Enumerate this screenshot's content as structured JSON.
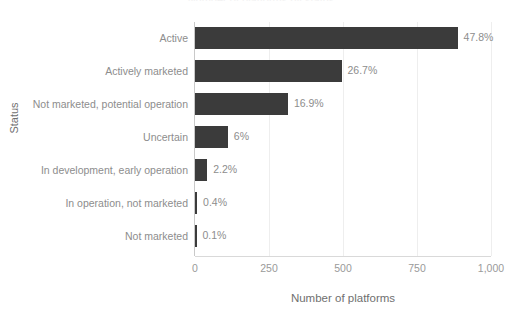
{
  "chart_data": {
    "type": "bar",
    "orientation": "horizontal",
    "title": "Number of platforms by status",
    "xlabel": "Number of platforms",
    "ylabel": "Status",
    "categories": [
      "Active",
      "Actively marketed",
      "Not marketed, potential operation",
      "Uncertain",
      "In development, early operation",
      "In operation, not marketed",
      "Not marketed"
    ],
    "values": [
      887,
      495,
      314,
      111,
      41,
      7,
      2
    ],
    "data_labels": [
      "47.8%",
      "26.7%",
      "16.9%",
      "6%",
      "2.2%",
      "0.4%",
      "0.1%"
    ],
    "percentages": [
      47.8,
      26.7,
      16.9,
      6.0,
      2.2,
      0.4,
      0.1
    ],
    "xlim": [
      0,
      1000
    ],
    "xticks": [
      0,
      250,
      500,
      750,
      1000
    ],
    "xtick_labels": [
      "0",
      "250",
      "500",
      "750",
      "1,000"
    ],
    "grid": true,
    "legend": false,
    "bar_color": "#3b3b3b",
    "text_color": "#8d8d8d",
    "grid_color": "#eeeeee"
  }
}
